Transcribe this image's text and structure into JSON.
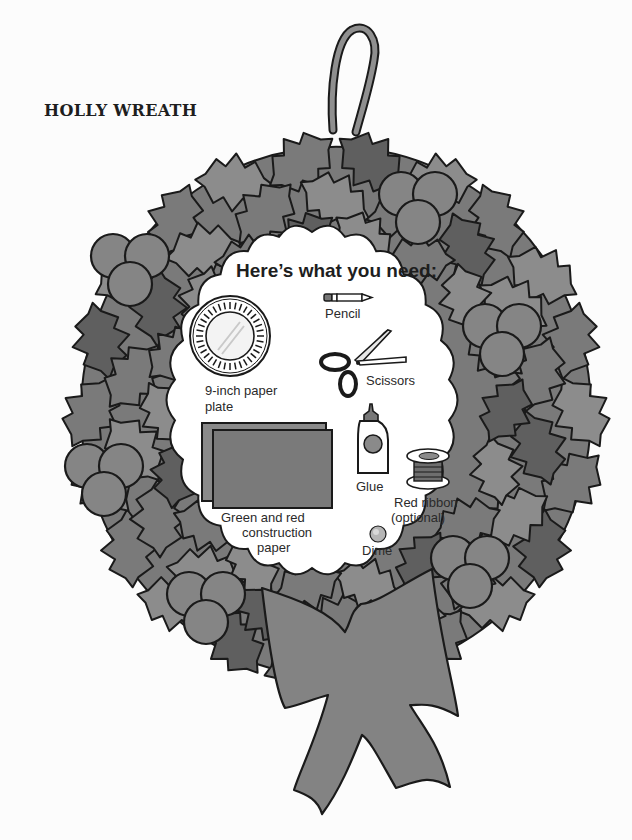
{
  "page": {
    "title": "HOLLY WREATH"
  },
  "needs_panel": {
    "heading": "Here’s what you need:",
    "items": [
      {
        "icon": "paper-plate-icon",
        "label_lines": [
          "9-inch paper",
          "plate"
        ]
      },
      {
        "icon": "pencil-icon",
        "label_lines": [
          "Pencil"
        ]
      },
      {
        "icon": "scissors-icon",
        "label_lines": [
          "Scissors"
        ]
      },
      {
        "icon": "construction-paper-icon",
        "label_lines": [
          "Green and red",
          "construction",
          "paper"
        ]
      },
      {
        "icon": "glue-bottle-icon",
        "label_lines": [
          "Glue"
        ]
      },
      {
        "icon": "ribbon-spool-icon",
        "label_lines": [
          "Red ribbon",
          "(optional)"
        ]
      },
      {
        "icon": "dime-icon",
        "label_lines": [
          "Dime"
        ]
      }
    ]
  },
  "colors": {
    "leaf_light": "#8c8c8c",
    "leaf_mid": "#7a7a7a",
    "leaf_dark": "#5f5f5f",
    "berry": "#858585",
    "bow": "#838383",
    "outline": "#1a1a1a",
    "panel": "#ffffff"
  }
}
